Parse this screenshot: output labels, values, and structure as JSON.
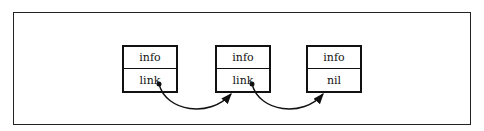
{
  "diagram": {
    "title": "",
    "type": "linked-list",
    "nodes": [
      {
        "id": "n1",
        "fields": [
          "info",
          "link"
        ]
      },
      {
        "id": "n2",
        "fields": [
          "info",
          "link"
        ]
      },
      {
        "id": "n3",
        "fields": [
          "info",
          "nil"
        ]
      }
    ],
    "edges": [
      {
        "from": "n1.link",
        "to": "n2"
      },
      {
        "from": "n2.link",
        "to": "n3"
      }
    ]
  }
}
